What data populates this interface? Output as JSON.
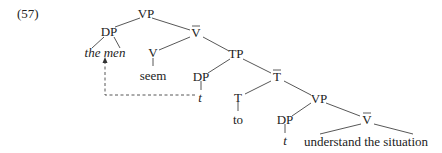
{
  "example_number": "(57)",
  "nodes": {
    "vp_root": "VP",
    "dp_subject": "DP",
    "the_men": "the men",
    "vbar_1": "V",
    "v_seem": "V",
    "seem": "seem",
    "tp": "TP",
    "dp_trace_1": "DP",
    "trace_1": "t",
    "tbar": "T",
    "t_head": "T",
    "to": "to",
    "vp_lower": "VP",
    "dp_trace_2": "DP",
    "trace_2": "t",
    "vbar_2": "V",
    "understand": "understand the situation"
  },
  "bar_nodes": [
    "vbar_1",
    "tbar",
    "vbar_2"
  ],
  "italic_nodes": [
    "the_men",
    "trace_1",
    "trace_2"
  ],
  "movement": {
    "from": "trace_1",
    "to": "the_men",
    "style": "dashed-arrow"
  }
}
